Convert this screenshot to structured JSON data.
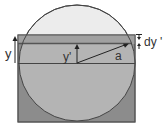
{
  "diagram": {
    "labels": {
      "y": "y",
      "y_prime": "y'",
      "a": "a",
      "dy_prime": "dy '"
    },
    "colors": {
      "background": "#ffffff",
      "circle_top_fill": "#ececec",
      "rectangle_fill": "#8c8c8c",
      "circle_inside_rect_fill": "#b4b4b4",
      "strip_fill": "#a0a0a0",
      "line": "#444444"
    }
  }
}
